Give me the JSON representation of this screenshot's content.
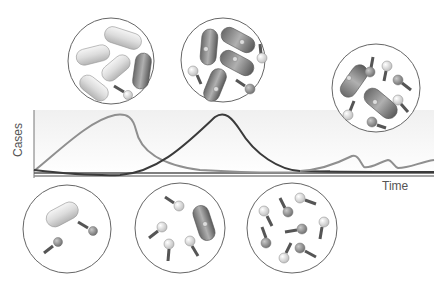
{
  "diagram": {
    "type": "phage-therapy-dynamics",
    "axes": {
      "x_label": "Time",
      "y_label": "Cases"
    },
    "curves": [
      {
        "name": "bacteria-curve",
        "color": "#8a8a8a",
        "description": "bacterial population rises, peaks, then collapses"
      },
      {
        "name": "phage-curve",
        "color": "#3a3a3a",
        "description": "phage population rises after bacteria, peaks later, then declines"
      },
      {
        "name": "resurgence-curve",
        "color": "#8a8a8a",
        "description": "small recurring oscillations at late time"
      }
    ],
    "colors": {
      "light_bacterium": "#d9d9d9",
      "dark_bacterium": "#7a7a7a",
      "phage_light": "#e6e6e6",
      "phage_dark": "#8c8c8c",
      "circle_border": "#666666",
      "plot_background": "#f4f4f4"
    },
    "panels": [
      {
        "name": "panel-bacteria-dominant",
        "position": "top-left",
        "light_bacteria": 4,
        "dark_bacteria": 1,
        "phages": 1
      },
      {
        "name": "panel-infected-bacteria",
        "position": "top-center",
        "light_bacteria": 0,
        "dark_bacteria": 4,
        "phages": 3
      },
      {
        "name": "panel-resurgence",
        "position": "top-right",
        "light_bacteria": 0,
        "dark_bacteria": 2,
        "phages": 7
      },
      {
        "name": "panel-initial",
        "position": "bottom-left",
        "light_bacteria": 1,
        "dark_bacteria": 0,
        "phages": 2
      },
      {
        "name": "panel-phage-growth",
        "position": "bottom-center",
        "light_bacteria": 0,
        "dark_bacteria": 1,
        "phages": 4
      },
      {
        "name": "panel-phage-dominant",
        "position": "bottom-right",
        "light_bacteria": 0,
        "dark_bacteria": 0,
        "phages": 9
      }
    ]
  }
}
